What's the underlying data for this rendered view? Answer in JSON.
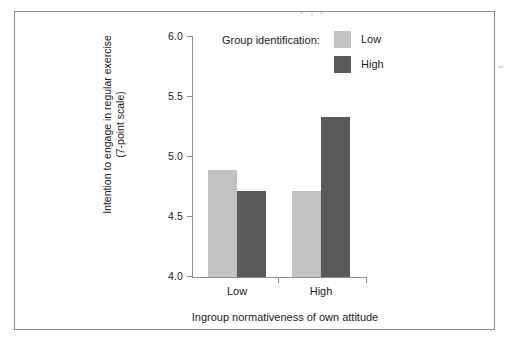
{
  "chart_data": {
    "type": "bar",
    "title": "",
    "xlabel": "Ingroup normativeness of own attitude",
    "ylabel": "Intention to engage in regular exercise (7-point scale)",
    "ylabel_line1": "Intention to engage in regular exercise",
    "ylabel_line2": "(7-point scale)",
    "categories": [
      "Low",
      "High"
    ],
    "series": [
      {
        "name": "Low",
        "values": [
          4.89,
          4.72
        ],
        "color": "#c2c2c2"
      },
      {
        "name": "High",
        "values": [
          4.72,
          5.33
        ],
        "color": "#5a5a5a"
      }
    ],
    "ylim": [
      4.0,
      6.0
    ],
    "yticks": [
      "6.0",
      "5.5",
      "5.0",
      "4.5",
      "4.0"
    ],
    "ytick_values": [
      6.0,
      5.5,
      5.0,
      4.5,
      4.0
    ],
    "grid": false,
    "legend_title": "Group identification:",
    "legend_position": "top-right-inside"
  },
  "legend": {
    "title": "Group identification:",
    "entries": [
      {
        "label": "Low",
        "color": "#c2c2c2"
      },
      {
        "label": "High",
        "color": "#5a5a5a"
      }
    ]
  },
  "axes": {
    "y_ticks": [
      "6.0",
      "5.5",
      "5.0",
      "4.5",
      "4.0"
    ],
    "x_categories": [
      "Low",
      "High"
    ],
    "x_title": "Ingroup normativeness of own attitude",
    "y_title_line1": "Intention to engage in regular exercise",
    "y_title_line2": "(7-point scale)"
  }
}
